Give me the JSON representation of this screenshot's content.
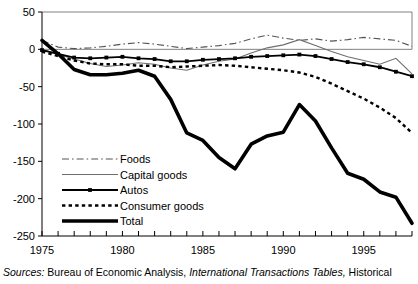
{
  "chart_data": {
    "type": "line",
    "title": "",
    "xlabel": "",
    "ylabel": "",
    "xlim": [
      1975,
      1998
    ],
    "ylim": [
      -250,
      50
    ],
    "yticks": [
      50,
      0,
      -50,
      -100,
      -150,
      -200,
      -250
    ],
    "ytick_labels": [
      "50",
      "0",
      "-50",
      "-100",
      "-150",
      "-200",
      "-250"
    ],
    "xticks": [
      1975,
      1980,
      1985,
      1990,
      1995
    ],
    "xtick_labels": [
      "1975",
      "1980",
      "1985",
      "1990",
      "1995"
    ],
    "x_minor_tick_step": 1,
    "grid": "horizontal-top-and-zero",
    "legend_position": "lower-left-inside",
    "x": [
      1975,
      1976,
      1977,
      1978,
      1979,
      1980,
      1981,
      1982,
      1983,
      1984,
      1985,
      1986,
      1987,
      1988,
      1989,
      1990,
      1991,
      1992,
      1993,
      1994,
      1995,
      1996,
      1997,
      1998
    ],
    "series": [
      {
        "name": "Foods",
        "style": "dash-dot",
        "color": "#555555",
        "values": [
          12,
          3,
          1,
          2,
          4,
          7,
          9,
          7,
          4,
          1,
          3,
          5,
          8,
          14,
          19,
          15,
          12,
          14,
          11,
          13,
          16,
          14,
          12,
          4
        ]
      },
      {
        "name": "Capital goods",
        "style": "thin-solid",
        "color": "#6e6e6e",
        "values": [
          0,
          -7,
          -13,
          -19,
          -23,
          -21,
          -18,
          -20,
          -25,
          -28,
          -21,
          -16,
          -13,
          -5,
          2,
          6,
          13,
          5,
          -3,
          -10,
          -15,
          -20,
          -12,
          -33
        ]
      },
      {
        "name": "Autos",
        "style": "solid-markers",
        "color": "#000000",
        "values": [
          -1,
          -6,
          -11,
          -12,
          -11,
          -10,
          -12,
          -13,
          -16,
          -16,
          -14,
          -13,
          -12,
          -10,
          -9,
          -8,
          -7,
          -9,
          -13,
          -17,
          -20,
          -24,
          -30,
          -36
        ]
      },
      {
        "name": "Consumer goods",
        "style": "dotted",
        "color": "#000000",
        "values": [
          -3,
          -9,
          -15,
          -19,
          -20,
          -20,
          -22,
          -22,
          -24,
          -23,
          -22,
          -21,
          -22,
          -24,
          -26,
          -28,
          -31,
          -37,
          -46,
          -56,
          -66,
          -78,
          -92,
          -112
        ]
      },
      {
        "name": "Total",
        "style": "thick-solid",
        "color": "#000000",
        "values": [
          12,
          -6,
          -27,
          -34,
          -34,
          -32,
          -28,
          -36,
          -67,
          -112,
          -122,
          -145,
          -160,
          -127,
          -116,
          -111,
          -74,
          -96,
          -132,
          -166,
          -174,
          -191,
          -198,
          -233
        ]
      }
    ]
  },
  "source_note": {
    "lead": "Sources:",
    "part1": "Bureau of Economic Analysis,",
    "publication": "International Transactions Tables,",
    "part2": "Historical"
  }
}
